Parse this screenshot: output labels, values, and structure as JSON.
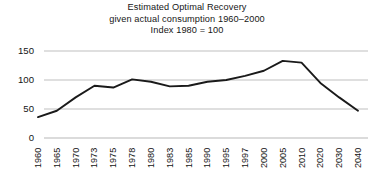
{
  "title": {
    "line1": "Estimated Optimal Recovery",
    "line2": "given actual consumption 1960–2000",
    "line3": "Index 1980 = 100"
  },
  "axes": {
    "y_ticks": [
      "0",
      "50",
      "100",
      "150"
    ],
    "x_ticks": [
      "1960",
      "1965",
      "1970",
      "1973",
      "1975",
      "1978",
      "1980",
      "1983",
      "1985",
      "1990",
      "1995",
      "1997",
      "2000",
      "2005",
      "2010",
      "2020",
      "2030",
      "2040"
    ]
  },
  "style": {
    "line_color": "#1a1a1a",
    "grid_color": "#b8b8b8",
    "background": "#ffffff",
    "text_color": "#141414"
  },
  "chart_data": {
    "type": "line",
    "title": "Estimated Optimal Recovery given actual consumption 1960–2000 Index 1980 = 100",
    "subtitle": "Index 1980 = 100",
    "xlabel": "",
    "ylabel": "",
    "ylim": [
      0,
      150
    ],
    "yticks": [
      0,
      50,
      100,
      150
    ],
    "grid": "horizontal",
    "legend": "none",
    "categories": [
      "1960",
      "1965",
      "1970",
      "1973",
      "1975",
      "1978",
      "1980",
      "1983",
      "1985",
      "1990",
      "1995",
      "1997",
      "2000",
      "2005",
      "2010",
      "2020",
      "2030",
      "2040"
    ],
    "values": [
      36,
      47,
      70,
      90,
      87,
      101,
      97,
      89,
      90,
      97,
      100,
      107,
      116,
      133,
      130,
      95,
      70,
      47
    ],
    "series": [
      {
        "name": "Estimated Optimal Recovery",
        "values": [
          36,
          47,
          70,
          90,
          87,
          101,
          97,
          89,
          90,
          97,
          100,
          107,
          116,
          133,
          130,
          95,
          70,
          47
        ]
      }
    ]
  }
}
